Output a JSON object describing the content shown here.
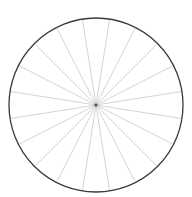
{
  "diagram": {
    "type": "spoked-circle",
    "canvas": {
      "width": 192,
      "height": 197
    },
    "center": {
      "x": 96,
      "y": 105
    },
    "radius": 87,
    "spoke_count": 20,
    "spoke_angle_offset_deg": 9,
    "colors": {
      "background": "#ffffff",
      "rim": "#3a3a3a",
      "spokes": "#c8c8c8",
      "center_dot": "#555555"
    },
    "rim_width": 1.3,
    "spoke_width": 0.8,
    "center_dot_radius": 1.6
  }
}
